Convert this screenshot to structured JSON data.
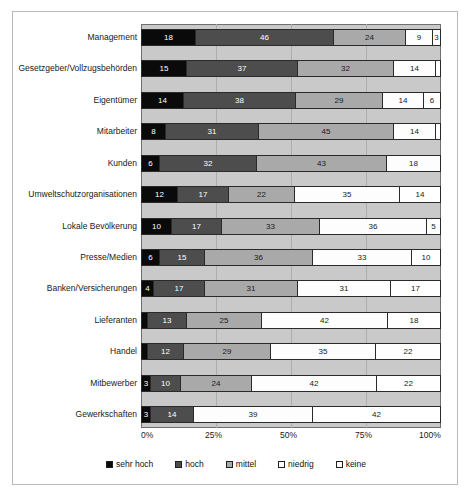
{
  "chart_data": {
    "type": "bar",
    "orientation": "horizontal",
    "stacked": true,
    "stack_mode": "percent",
    "title": "",
    "subtitle": "",
    "xlabel": "",
    "ylabel": "",
    "xlim": [
      0,
      100
    ],
    "xticks": [
      "0%",
      "25%",
      "50%",
      "75%",
      "100%"
    ],
    "xtick_values": [
      0,
      25,
      50,
      75,
      100
    ],
    "grid": true,
    "grid_axis": "x",
    "legend_position": "bottom",
    "legend": [
      "sehr hoch",
      "hoch",
      "mittel",
      "niedrig",
      "keine"
    ],
    "categories": [
      "Management",
      "Gesetzgeber/Vollzugsbehörden",
      "Eigentümer",
      "Mitarbeiter",
      "Kunden",
      "Umweltschutzorganisationen",
      "Lokale Bevölkerung",
      "Presse/Medien",
      "Banken/Versicherungen",
      "Lieferanten",
      "Handel",
      "Mitbewerber",
      "Gewerkschaften"
    ],
    "series": [
      {
        "name": "sehr hoch",
        "color": "#0a0a0a",
        "values": [
          18,
          15,
          14,
          8,
          6,
          12,
          10,
          6,
          4,
          2,
          2,
          3,
          3
        ]
      },
      {
        "name": "hoch",
        "color": "#4d4d4d",
        "values": [
          46,
          37,
          38,
          31,
          32,
          17,
          17,
          15,
          17,
          13,
          12,
          10,
          14
        ]
      },
      {
        "name": "mittel",
        "color": "#a9a9a9",
        "values": [
          24,
          32,
          29,
          45,
          43,
          22,
          33,
          36,
          31,
          25,
          29,
          24,
          0
        ]
      },
      {
        "name": "niedrig",
        "color": "#fdfdfd",
        "values": [
          9,
          14,
          14,
          14,
          18,
          35,
          36,
          33,
          31,
          42,
          35,
          42,
          39
        ]
      },
      {
        "name": "keine",
        "color": "#ffffff",
        "values": [
          3,
          2,
          6,
          2,
          0,
          14,
          5,
          10,
          17,
          18,
          22,
          22,
          42
        ]
      }
    ],
    "rows": [
      {
        "label": "Management",
        "segments": [
          {
            "series": "sehr hoch",
            "value": 18,
            "label": "18"
          },
          {
            "series": "hoch",
            "value": 46,
            "label": "46"
          },
          {
            "series": "mittel",
            "value": 24,
            "label": "24"
          },
          {
            "series": "niedrig",
            "value": 9,
            "label": "9"
          },
          {
            "series": "keine",
            "value": 3,
            "label": "3"
          }
        ]
      },
      {
        "label": "Gesetzgeber/Vollzugsbehörden",
        "segments": [
          {
            "series": "sehr hoch",
            "value": 15,
            "label": "15"
          },
          {
            "series": "hoch",
            "value": 37,
            "label": "37"
          },
          {
            "series": "mittel",
            "value": 32,
            "label": "32"
          },
          {
            "series": "niedrig",
            "value": 14,
            "label": "14"
          },
          {
            "series": "keine",
            "value": 2,
            "label": ""
          }
        ]
      },
      {
        "label": "Eigentümer",
        "segments": [
          {
            "series": "sehr hoch",
            "value": 14,
            "label": "14"
          },
          {
            "series": "hoch",
            "value": 38,
            "label": "38"
          },
          {
            "series": "mittel",
            "value": 29,
            "label": "29"
          },
          {
            "series": "niedrig",
            "value": 14,
            "label": "14"
          },
          {
            "series": "keine",
            "value": 6,
            "label": "6"
          }
        ]
      },
      {
        "label": "Mitarbeiter",
        "segments": [
          {
            "series": "sehr hoch",
            "value": 8,
            "label": "8"
          },
          {
            "series": "hoch",
            "value": 31,
            "label": "31"
          },
          {
            "series": "mittel",
            "value": 45,
            "label": "45"
          },
          {
            "series": "niedrig",
            "value": 14,
            "label": "14"
          },
          {
            "series": "keine",
            "value": 2,
            "label": ""
          }
        ]
      },
      {
        "label": "Kunden",
        "segments": [
          {
            "series": "sehr hoch",
            "value": 6,
            "label": "6"
          },
          {
            "series": "hoch",
            "value": 32,
            "label": "32"
          },
          {
            "series": "mittel",
            "value": 43,
            "label": "43"
          },
          {
            "series": "niedrig",
            "value": 18,
            "label": "18"
          },
          {
            "series": "keine",
            "value": 0,
            "label": ""
          }
        ]
      },
      {
        "label": "Umweltschutzorganisationen",
        "segments": [
          {
            "series": "sehr hoch",
            "value": 12,
            "label": "12"
          },
          {
            "series": "hoch",
            "value": 17,
            "label": "17"
          },
          {
            "series": "mittel",
            "value": 22,
            "label": "22"
          },
          {
            "series": "niedrig",
            "value": 35,
            "label": "35"
          },
          {
            "series": "keine",
            "value": 14,
            "label": "14"
          }
        ]
      },
      {
        "label": "Lokale Bevölkerung",
        "segments": [
          {
            "series": "sehr hoch",
            "value": 10,
            "label": "10"
          },
          {
            "series": "hoch",
            "value": 17,
            "label": "17"
          },
          {
            "series": "mittel",
            "value": 33,
            "label": "33"
          },
          {
            "series": "niedrig",
            "value": 36,
            "label": "36"
          },
          {
            "series": "keine",
            "value": 5,
            "label": "5"
          }
        ]
      },
      {
        "label": "Presse/Medien",
        "segments": [
          {
            "series": "sehr hoch",
            "value": 6,
            "label": "6"
          },
          {
            "series": "hoch",
            "value": 15,
            "label": "15"
          },
          {
            "series": "mittel",
            "value": 36,
            "label": "36"
          },
          {
            "series": "niedrig",
            "value": 33,
            "label": "33"
          },
          {
            "series": "keine",
            "value": 10,
            "label": "10"
          }
        ]
      },
      {
        "label": "Banken/Versicherungen",
        "segments": [
          {
            "series": "sehr hoch",
            "value": 4,
            "label": "4"
          },
          {
            "series": "hoch",
            "value": 17,
            "label": "17"
          },
          {
            "series": "mittel",
            "value": 31,
            "label": "31"
          },
          {
            "series": "niedrig",
            "value": 31,
            "label": "31"
          },
          {
            "series": "keine",
            "value": 17,
            "label": "17"
          }
        ]
      },
      {
        "label": "Lieferanten",
        "segments": [
          {
            "series": "sehr hoch",
            "value": 2,
            "label": "2"
          },
          {
            "series": "hoch",
            "value": 13,
            "label": "13"
          },
          {
            "series": "mittel",
            "value": 25,
            "label": "25"
          },
          {
            "series": "niedrig",
            "value": 42,
            "label": "42"
          },
          {
            "series": "keine",
            "value": 18,
            "label": "18"
          }
        ]
      },
      {
        "label": "Handel",
        "segments": [
          {
            "series": "sehr hoch",
            "value": 2,
            "label": "2"
          },
          {
            "series": "hoch",
            "value": 12,
            "label": "12"
          },
          {
            "series": "mittel",
            "value": 29,
            "label": "29"
          },
          {
            "series": "niedrig",
            "value": 35,
            "label": "35"
          },
          {
            "series": "keine",
            "value": 22,
            "label": "22"
          }
        ]
      },
      {
        "label": "Mitbewerber",
        "segments": [
          {
            "series": "sehr hoch",
            "value": 3,
            "label": "3"
          },
          {
            "series": "hoch",
            "value": 10,
            "label": "10"
          },
          {
            "series": "mittel",
            "value": 24,
            "label": "24"
          },
          {
            "series": "niedrig",
            "value": 42,
            "label": "42"
          },
          {
            "series": "keine",
            "value": 22,
            "label": "22"
          }
        ]
      },
      {
        "label": "Gewerkschaften",
        "segments": [
          {
            "series": "sehr hoch",
            "value": 3,
            "label": "3"
          },
          {
            "series": "hoch",
            "value": 14,
            "label": "14"
          },
          {
            "series": "mittel",
            "value": 0,
            "label": ""
          },
          {
            "series": "niedrig",
            "value": 39,
            "label": "39"
          },
          {
            "series": "keine",
            "value": 42,
            "label": "42"
          }
        ]
      }
    ]
  },
  "legend": {
    "items": [
      {
        "label": "sehr hoch",
        "swatch": "sehr-hoch"
      },
      {
        "label": "hoch",
        "swatch": "hoch"
      },
      {
        "label": "mittel",
        "swatch": "mittel"
      },
      {
        "label": "niedrig",
        "swatch": "niedrig"
      },
      {
        "label": "keine",
        "swatch": "keine"
      }
    ]
  },
  "axis": {
    "ticks": [
      "0%",
      "25%",
      "50%",
      "75%",
      "100%"
    ]
  },
  "colors": {
    "sehr_hoch": "#0a0a0a",
    "hoch": "#4d4d4d",
    "mittel": "#a9a9a9",
    "niedrig": "#fdfdfd",
    "keine": "#ffffff",
    "plot_background": "#c9c9c9",
    "gridline": "#aeaeae",
    "frame": "#b9b9b9"
  }
}
